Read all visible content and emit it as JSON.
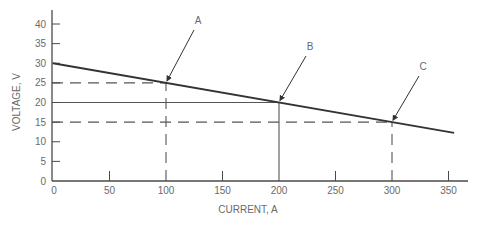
{
  "chart_data": {
    "type": "line",
    "title": "",
    "xlabel": "CURRENT, A",
    "ylabel": "VOLTAGE, V",
    "xlim": [
      0,
      365
    ],
    "ylim": [
      0,
      43
    ],
    "x_ticks": [
      0,
      50,
      100,
      150,
      200,
      250,
      300,
      350
    ],
    "y_ticks": [
      0,
      5,
      10,
      15,
      20,
      25,
      30,
      35,
      40
    ],
    "grid": false,
    "legend": null,
    "series": [
      {
        "name": "load line",
        "style": "solid",
        "x": [
          0,
          355
        ],
        "y": [
          30,
          12.25
        ]
      }
    ],
    "reference_lines": [
      {
        "name": "A-horizontal",
        "style": "dashed",
        "from": [
          0,
          25
        ],
        "to": [
          100,
          25
        ]
      },
      {
        "name": "A-vertical",
        "style": "dashed",
        "from": [
          100,
          0
        ],
        "to": [
          100,
          25
        ]
      },
      {
        "name": "B-horizontal",
        "style": "solid",
        "from": [
          0,
          20
        ],
        "to": [
          200,
          20
        ]
      },
      {
        "name": "B-vertical",
        "style": "solid",
        "from": [
          200,
          0
        ],
        "to": [
          200,
          20
        ]
      },
      {
        "name": "C-horizontal",
        "style": "dashed",
        "from": [
          0,
          15
        ],
        "to": [
          300,
          15
        ]
      },
      {
        "name": "C-vertical",
        "style": "dashed",
        "from": [
          300,
          0
        ],
        "to": [
          300,
          15
        ]
      }
    ],
    "annotations": [
      {
        "label": "A",
        "point": [
          100,
          25
        ],
        "label_pos_px": [
          198,
          24
        ]
      },
      {
        "label": "B",
        "point": [
          200,
          20
        ],
        "label_pos_px": [
          310,
          50
        ]
      },
      {
        "label": "C",
        "point": [
          300,
          15
        ],
        "label_pos_px": [
          423,
          70
        ]
      }
    ]
  },
  "colors": {
    "axis": "#4a4a4a",
    "line": "#333333",
    "text": "#6a6a6a",
    "background": "#ffffff"
  }
}
